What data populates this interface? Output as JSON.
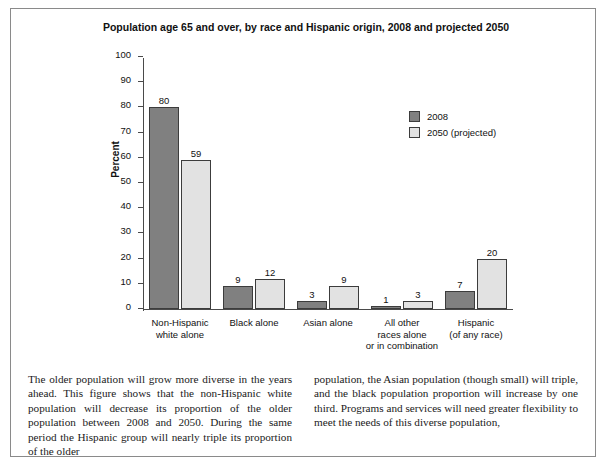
{
  "figure": {
    "title": "Population age 65 and over, by race and Hispanic origin,\n2008 and projected 2050"
  },
  "chart_data": {
    "type": "bar",
    "title": "Population age 65 and over, by race and Hispanic origin, 2008 and projected 2050",
    "xlabel": "",
    "ylabel": "Percent",
    "ylim": [
      0,
      100
    ],
    "ytick_values": [
      0,
      10,
      20,
      30,
      40,
      50,
      60,
      70,
      80,
      90,
      100
    ],
    "ytick_labels": [
      "0",
      "10",
      "20",
      "30",
      "40",
      "50",
      "60",
      "70",
      "80",
      "90",
      "100"
    ],
    "grid": false,
    "legend_position": "upper-right-inside",
    "categories": [
      "Non-Hispanic\nwhite alone",
      "Black alone",
      "Asian alone",
      "All other\nraces alone\nor in combination",
      "Hispanic\n(of any race)"
    ],
    "series": [
      {
        "name": "2008",
        "color": "#808080",
        "values": [
          80,
          9,
          3,
          1,
          7
        ]
      },
      {
        "name": "2050 (projected)",
        "color": "#e2e2e2",
        "values": [
          59,
          12,
          9,
          3,
          20
        ]
      }
    ]
  },
  "caption": {
    "left": "The older population will grow more diverse in the years ahead. This figure shows that the non-Hispanic white population will decrease its proportion of the older population between 2008 and 2050. During the same period the Hispanic group will nearly triple its proportion of the older",
    "right": "population, the Asian population (though small) will triple, and the black population proportion will increase by one third. Programs and services will need greater flexibility to meet the needs of this diverse population,"
  }
}
